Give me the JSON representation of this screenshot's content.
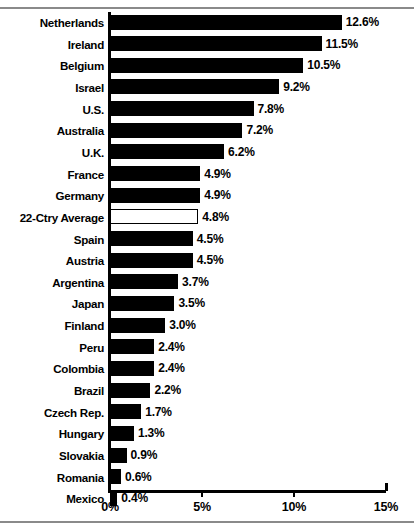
{
  "chart_data": {
    "type": "bar",
    "orientation": "horizontal",
    "title": "",
    "subtitle": "",
    "xlabel": "",
    "ylabel": "",
    "xlim": [
      0,
      15
    ],
    "grid": false,
    "legend": null,
    "value_suffix": "%",
    "axis_ticks": [
      {
        "value": 0,
        "label": "0%"
      },
      {
        "value": 5,
        "label": "5%"
      },
      {
        "value": 10,
        "label": "10%"
      },
      {
        "value": 15,
        "label": "15%"
      }
    ],
    "categories": [
      "Netherlands",
      "Ireland",
      "Belgium",
      "Israel",
      "U.S.",
      "Australia",
      "U.K.",
      "France",
      "Germany",
      "22-Ctry Average",
      "Spain",
      "Austria",
      "Argentina",
      "Japan",
      "Finland",
      "Peru",
      "Colombia",
      "Brazil",
      "Czech Rep.",
      "Hungary",
      "Slovakia",
      "Romania",
      "Mexico"
    ],
    "values": [
      12.6,
      11.5,
      10.5,
      9.2,
      7.8,
      7.2,
      6.2,
      4.9,
      4.9,
      4.8,
      4.5,
      4.5,
      3.7,
      3.5,
      3.0,
      2.4,
      2.4,
      2.2,
      1.7,
      1.3,
      0.9,
      0.6,
      0.4
    ],
    "data_labels": [
      "12.6%",
      "11.5%",
      "10.5%",
      "9.2%",
      "7.8%",
      "7.2%",
      "6.2%",
      "4.9%",
      "4.9%",
      "4.8%",
      "4.5%",
      "4.5%",
      "3.7%",
      "3.5%",
      "3.0%",
      "2.4%",
      "2.4%",
      "2.2%",
      "1.7%",
      "1.3%",
      "0.9%",
      "0.6%",
      "0.4%"
    ],
    "highlighted_category": "22-Ctry Average",
    "bar_fill_color": "#000000",
    "bar_highlight_fill_color": "#ffffff",
    "bar_outline_color": "#000000",
    "axis_color": "#000000",
    "background_color": "#ffffff"
  }
}
